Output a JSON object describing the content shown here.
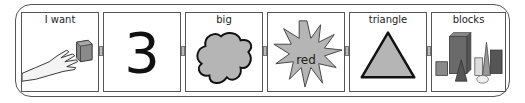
{
  "sentence_strip": {
    "panels": [
      {
        "label": "I want",
        "icon": "hand-reaching-cube-icon"
      },
      {
        "label": "",
        "value": "3",
        "icon": "number-three"
      },
      {
        "label": "big",
        "icon": "blob-shape-icon"
      },
      {
        "label": "",
        "overlay_text": "red",
        "icon": "starburst-icon"
      },
      {
        "label": "triangle",
        "icon": "triangle-icon"
      },
      {
        "label": "blocks",
        "icon": "blocks-icon"
      }
    ]
  },
  "colors": {
    "border": "#555555",
    "shape_fill": "#b5b5b5",
    "connector": "#bbbbbb"
  }
}
